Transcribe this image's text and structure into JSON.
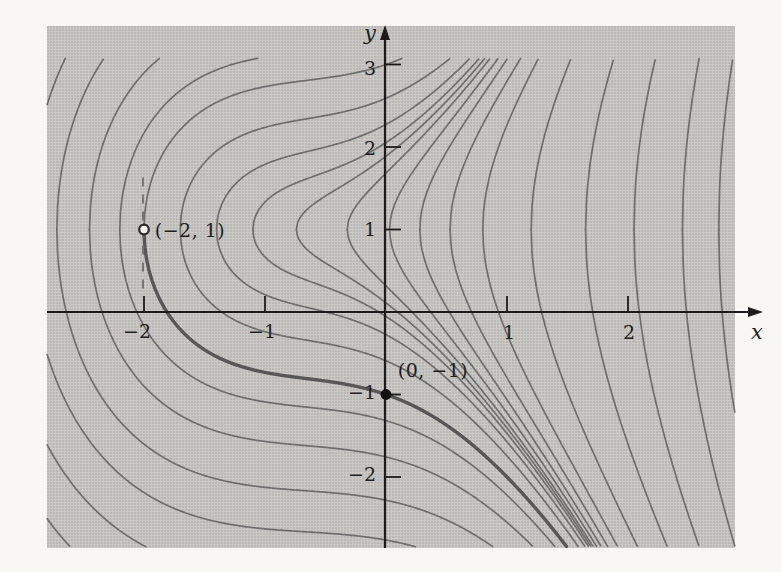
{
  "figure": {
    "kind": "textbook-math-figure"
  },
  "chart_data": {
    "type": "line",
    "subtype": "contour-family-of-integral-curves",
    "implicit_family": "(y-1)^2 = x^3 + 2x^2 + 2x + k",
    "curves": {
      "vertex_x": [
        -3.45,
        -3.2,
        -2.95,
        -2.72,
        -2.45,
        -2.2,
        -2.0,
        -1.7,
        -1.4,
        -1.1,
        -0.74,
        -0.32,
        0.03,
        0.28,
        0.53,
        0.8,
        1.2,
        1.65,
        2.05,
        2.45,
        2.75
      ],
      "note": "each curve is symmetric about y=1 with vertical tangent at its vertex (x0,1); k = -(x0^3+2x0^2+2x0)"
    },
    "highlighted": {
      "k": 4,
      "branch": "lower",
      "x_start": -2.0,
      "passes_through": [
        [
          -2,
          1
        ],
        [
          0,
          -1
        ]
      ]
    },
    "points": [
      {
        "x": -2,
        "y": 1,
        "style": "open",
        "label": "(−2, 1)"
      },
      {
        "x": 0,
        "y": -1,
        "style": "filled",
        "label": "(0, −1)"
      }
    ],
    "dashed_line": {
      "x": -2,
      "y_from": 1.63,
      "y_to": 0.27
    },
    "x_axis": {
      "label": "x",
      "range": [
        -2.8,
        2.885
      ],
      "ticks": [
        {
          "v": -2,
          "label": "−2"
        },
        {
          "v": -1,
          "label": "−1"
        },
        {
          "v": 1,
          "label": "1"
        },
        {
          "v": 2,
          "label": "2"
        }
      ]
    },
    "y_axis": {
      "label": "y",
      "range": [
        -2.86,
        3.45
      ],
      "ticks": [
        {
          "v": 3,
          "label": "3"
        },
        {
          "v": 2,
          "label": "2"
        },
        {
          "v": 1,
          "label": "1"
        },
        {
          "v": -1,
          "label": "−1"
        },
        {
          "v": -2,
          "label": "−2"
        }
      ]
    },
    "grid": false,
    "legend": false,
    "colors": {
      "plot_background": "#c9c8c4",
      "curve": "#6e6e6e",
      "highlighted_curve": "#575757",
      "axis": "#1b1b1b",
      "dashed_line": "#6a6a6a",
      "open_point_fill": "#f4f3ef",
      "filled_point": "#111111"
    }
  }
}
